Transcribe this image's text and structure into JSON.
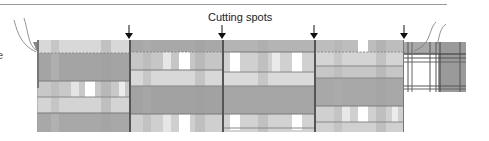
{
  "diagram": {
    "title": "Cutting spots",
    "edge_label_fragment": "e",
    "arrow_icon": "down-arrow",
    "cut_positions_px": [
      129,
      222,
      314,
      404
    ],
    "panels": [
      {
        "id": 1,
        "label": "fabric-panel-1",
        "x": 37,
        "width": 92
      },
      {
        "id": 2,
        "label": "fabric-panel-2",
        "x": 129,
        "width": 93
      },
      {
        "id": 3,
        "label": "fabric-panel-3",
        "x": 222,
        "width": 92
      },
      {
        "id": 4,
        "label": "fabric-panel-4",
        "x": 314,
        "width": 90
      }
    ],
    "end_panel": {
      "label": "fabric-end-piece",
      "x": 404,
      "width": 62
    },
    "colors": {
      "plaid_dark": "#8e8e8e",
      "plaid_mid": "#b4b4b4",
      "plaid_light": "#d6d6d6",
      "plaid_white": "#ffffff",
      "line": "#555555",
      "arrow": "#111111"
    }
  }
}
